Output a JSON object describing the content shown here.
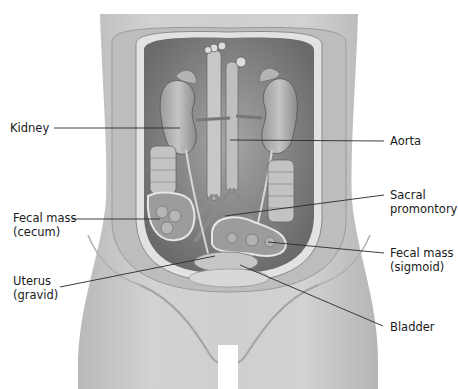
{
  "figure": {
    "labels": [
      {
        "id": "kidney",
        "text": "Kidney",
        "side": "left"
      },
      {
        "id": "fecal-mass-cecum",
        "text": "Fecal mass\n(cecum)",
        "side": "left"
      },
      {
        "id": "uterus-gravid",
        "text": "Uterus\n(gravid)",
        "side": "left"
      },
      {
        "id": "aorta",
        "text": "Aorta",
        "side": "right"
      },
      {
        "id": "sacral-promontory",
        "text": "Sacral\npromontory",
        "side": "right"
      },
      {
        "id": "fecal-mass-sigmoid",
        "text": "Fecal mass\n(sigmoid)",
        "side": "right"
      },
      {
        "id": "bladder",
        "text": "Bladder",
        "side": "right"
      }
    ],
    "colors": {
      "background": "#ffffff",
      "skin": "#c9c9c9",
      "skin_shadow": "#a9a9a9",
      "cavity": "#8a8a8a",
      "organ": "#b8b8b8",
      "organ_dark": "#6e6e6e",
      "leader_line": "#2a2a2a",
      "text": "#1a1a1a"
    }
  }
}
